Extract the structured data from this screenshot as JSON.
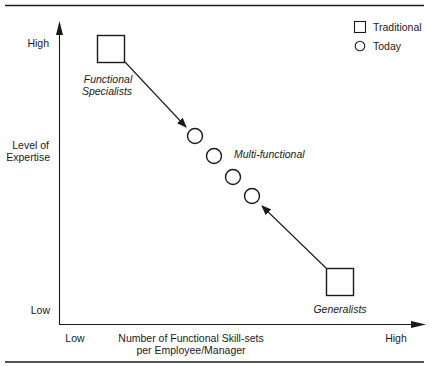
{
  "diagram": {
    "y_axis": {
      "label_line1": "Level of",
      "label_line2": "Expertise",
      "high_label": "High",
      "low_label": "Low"
    },
    "x_axis": {
      "label_line1": "Number of Functional Skill-sets",
      "label_line2": "per Employee/Manager",
      "low_label": "Low",
      "high_label": "High"
    },
    "legend": {
      "items": [
        {
          "symbol": "square",
          "label": "Traditional"
        },
        {
          "symbol": "circle",
          "label": "Today"
        }
      ]
    },
    "nodes": {
      "specialists": {
        "type": "Traditional",
        "label_line1": "Functional",
        "label_line2": "Specialists",
        "expertise": "high",
        "skill_sets": "low"
      },
      "generalists": {
        "type": "Traditional",
        "label": "Generalists",
        "expertise": "low",
        "skill_sets": "high"
      },
      "multi_functional": {
        "type": "Today",
        "label": "Multi-functional",
        "count": 4
      }
    },
    "arrows": [
      {
        "from": "Functional Specialists",
        "to": "Multi-functional"
      },
      {
        "from": "Generalists",
        "to": "Multi-functional"
      }
    ],
    "colors": {
      "ink": "#1a1a1a",
      "background": "#ffffff"
    }
  }
}
